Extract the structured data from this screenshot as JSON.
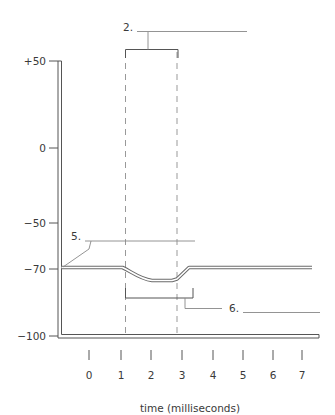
{
  "diagram": {
    "y_axis": {
      "ticks": [
        {
          "label": "+50",
          "value": 50
        },
        {
          "label": "0",
          "value": 0
        },
        {
          "label": "−50",
          "value": -50
        },
        {
          "label": "−70",
          "value": -70
        },
        {
          "label": "−100",
          "value": -100
        }
      ]
    },
    "x_axis": {
      "label": "time (milliseconds)",
      "ticks": [
        "0",
        "1",
        "2",
        "3",
        "4",
        "5",
        "6",
        "7"
      ]
    },
    "callouts": {
      "c2": {
        "number": "2.",
        "blank": ""
      },
      "c5": {
        "number": "5.",
        "blank": ""
      },
      "c6": {
        "number": "6.",
        "blank": ""
      }
    },
    "trace": {
      "resting_mV": -70,
      "min_mV": -78,
      "dip_start_ms": 1.1,
      "dip_end_ms": 3.5
    },
    "colors": {
      "axis": "#555555",
      "trace": "#666666",
      "dashed": "#999999",
      "text": "#3a3a3a"
    }
  }
}
